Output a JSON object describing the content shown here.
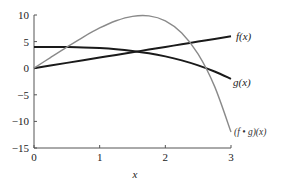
{
  "chart_data": {
    "type": "line",
    "title": "",
    "xlabel": "x",
    "ylabel": "",
    "xlim": [
      0,
      3
    ],
    "ylim": [
      -15,
      10
    ],
    "x_ticks": [
      "0",
      "1",
      "2",
      "3"
    ],
    "y_ticks": [
      "10",
      "5",
      "0",
      "−5",
      "−10",
      "−15"
    ],
    "grid": false,
    "legend": "inline labels at right end of curves",
    "x": [
      0,
      0.25,
      0.5,
      0.75,
      1,
      1.25,
      1.5,
      1.75,
      2,
      2.25,
      2.5,
      2.75,
      3
    ],
    "series": [
      {
        "name": "f(x)",
        "color": "#1a1a1a",
        "values": [
          0,
          0.5,
          1,
          1.5,
          2,
          2.5,
          3,
          3.5,
          4,
          4.5,
          5,
          5.5,
          6
        ]
      },
      {
        "name": "g(x)",
        "color": "#1a1a1a",
        "values": [
          4,
          4.0,
          3.97,
          3.91,
          3.78,
          3.57,
          3.25,
          2.81,
          2.22,
          1.47,
          0.53,
          -0.62,
          -2
        ]
      },
      {
        "name": "(f • g)(x)",
        "color": "#8a8a8a",
        "values": [
          0,
          2.0,
          3.97,
          5.86,
          7.56,
          8.92,
          9.75,
          9.83,
          8.89,
          6.61,
          2.64,
          -3.42,
          -12
        ]
      }
    ]
  }
}
